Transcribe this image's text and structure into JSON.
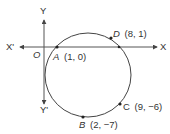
{
  "diagram": {
    "axes": {
      "x_positive_label": "X",
      "x_negative_label": "X'",
      "y_positive_label": "Y",
      "y_negative_label": "Y'",
      "origin_label": "O"
    },
    "circle": {
      "points": [
        {
          "name": "A",
          "coords": "(1, 0)"
        },
        {
          "name": "D",
          "coords": "(8, 1)"
        },
        {
          "name": "C",
          "coords": "(9, −6)"
        },
        {
          "name": "B",
          "coords": "(2, −7)"
        }
      ]
    },
    "colors": {
      "stroke": "#444444",
      "text": "#333333",
      "background": "#ffffff"
    }
  }
}
